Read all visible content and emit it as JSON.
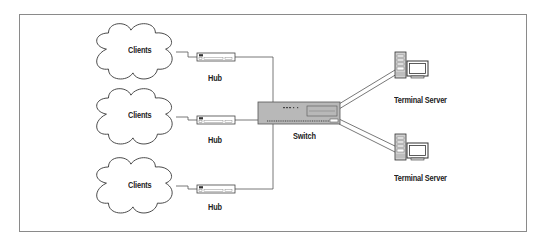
{
  "diagram": {
    "type": "network-topology",
    "clients": [
      {
        "label": "Clients"
      },
      {
        "label": "Clients"
      },
      {
        "label": "Clients"
      }
    ],
    "hubs": [
      {
        "label": "Hub"
      },
      {
        "label": "Hub"
      },
      {
        "label": "Hub"
      }
    ],
    "switch": {
      "label": "Switch"
    },
    "servers": [
      {
        "label": "Terminal Server"
      },
      {
        "label": "Terminal Server"
      }
    ],
    "colors": {
      "line": "#555555",
      "switch_fill": "#b8b8b8",
      "frame": "#8a8a8a"
    }
  }
}
